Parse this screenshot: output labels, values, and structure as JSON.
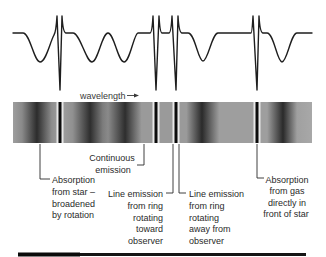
{
  "figure": {
    "axis_label": "wavelength",
    "axis_arrow_icon": "arrow-right-icon",
    "labels": {
      "star_absorption": {
        "lines": [
          "Absorption",
          "from star –",
          "broadened",
          "by rotation"
        ]
      },
      "continuous_emission": {
        "lines": [
          "Continuous",
          "emission"
        ]
      },
      "line_emission_toward": {
        "lines": [
          "Line emission",
          "from ring",
          "rotating",
          "toward",
          "observer"
        ]
      },
      "line_emission_away": {
        "lines": [
          "Line emission",
          "from ring",
          "rotating",
          "away from",
          "observer"
        ]
      },
      "gas_absorption": {
        "lines": [
          "Absorption",
          "from gas",
          "directly in",
          "front of star"
        ]
      }
    },
    "colors": {
      "line": "#1e1e1e",
      "spectrum_base": "#9e9e9e",
      "spectrum_dark": "#2c2c2c",
      "text": "#2a2a2a"
    }
  }
}
